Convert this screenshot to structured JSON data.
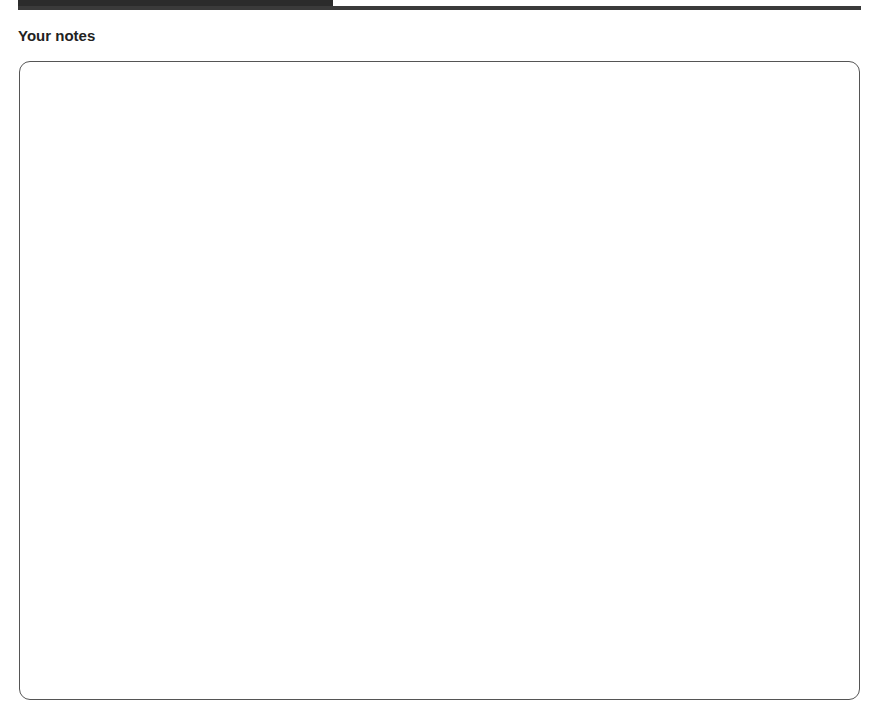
{
  "header": {
    "bar_color": "#2b2b2b"
  },
  "notes": {
    "heading": "Your notes",
    "content": ""
  }
}
